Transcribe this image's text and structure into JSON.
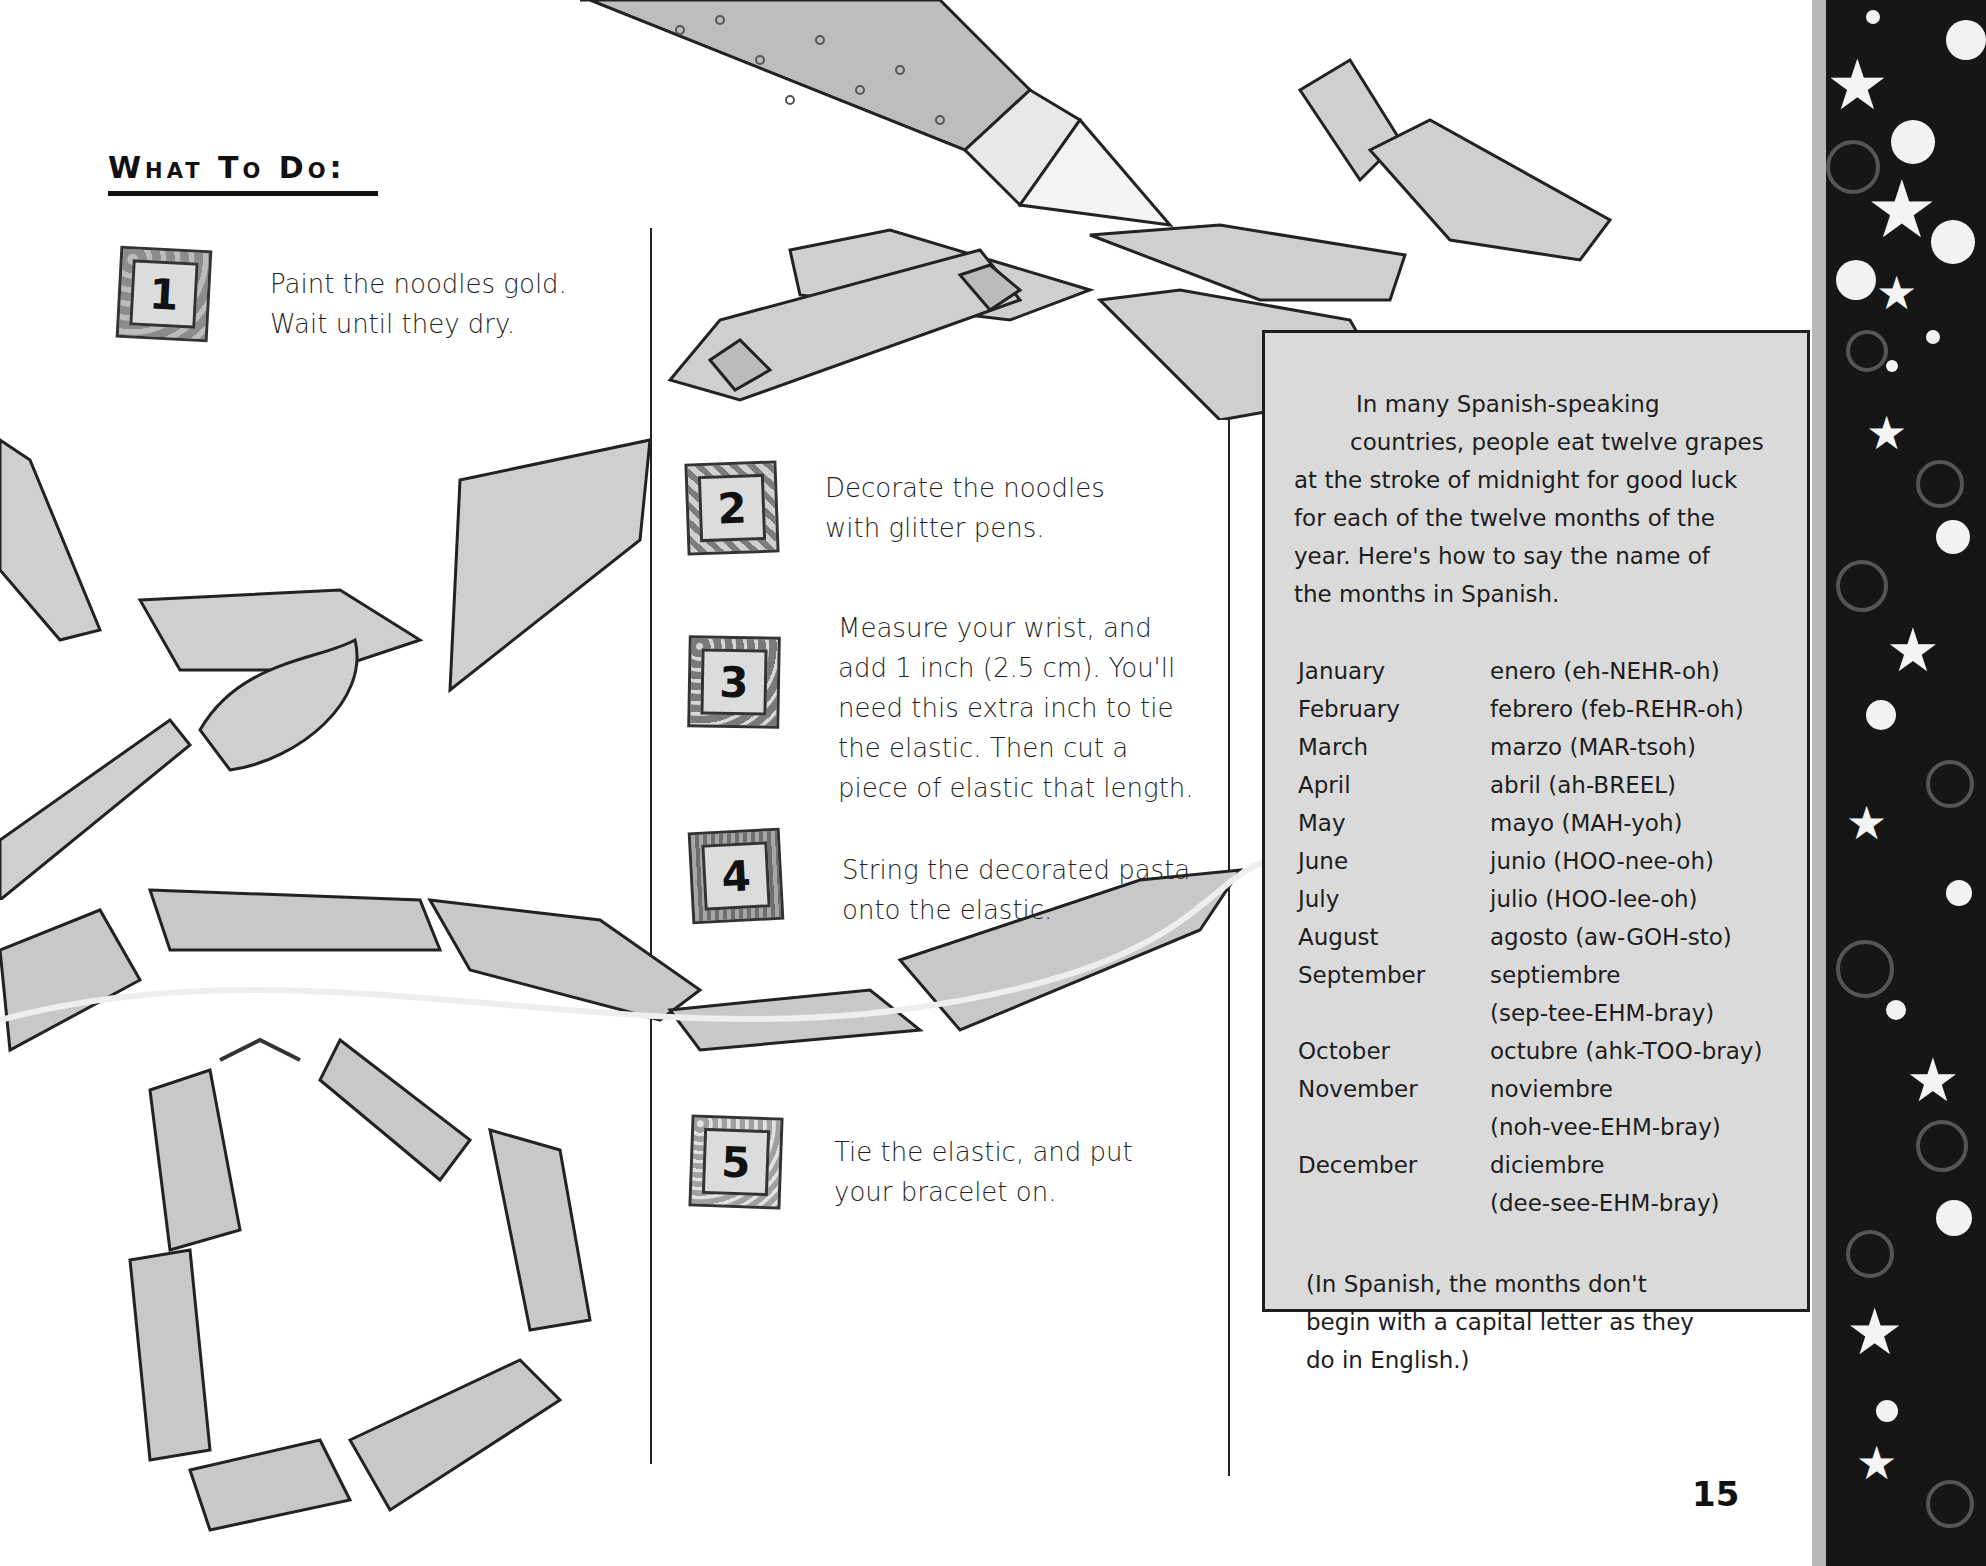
{
  "page": {
    "heading": "What To Do:",
    "page_number": "15"
  },
  "steps": [
    {
      "number": "1",
      "lines": [
        "Paint the noodles gold.",
        "Wait until they dry."
      ]
    },
    {
      "number": "2",
      "lines": [
        "Decorate the noodles",
        "with glitter pens."
      ]
    },
    {
      "number": "3",
      "lines": [
        "Measure your wrist, and",
        "add 1 inch (2.5 cm). You'll",
        "need this extra inch to tie",
        "the elastic. Then cut a",
        "piece of elastic that length."
      ]
    },
    {
      "number": "4",
      "lines": [
        "String the decorated pasta",
        "onto the elastic."
      ]
    },
    {
      "number": "5",
      "lines": [
        "Tie the elastic, and put",
        "your bracelet on."
      ]
    }
  ],
  "sidebar": {
    "intro_lines": [
      "In many Spanish-speaking",
      "countries, people eat twelve grapes",
      "at the stroke of midnight for good luck",
      "for each of the twelve months of the",
      "year. Here's how to say the name of",
      "the months in Spanish."
    ],
    "months": [
      {
        "english": "January",
        "spanish": "enero (eh-NEHR-oh)"
      },
      {
        "english": "February",
        "spanish": "febrero (feb-REHR-oh)"
      },
      {
        "english": "March",
        "spanish": "marzo (MAR-tsoh)"
      },
      {
        "english": "April",
        "spanish": "abril (ah-BREEL)"
      },
      {
        "english": "May",
        "spanish": "mayo (MAH-yoh)"
      },
      {
        "english": "June",
        "spanish": "junio (HOO-nee-oh)"
      },
      {
        "english": "July",
        "spanish": "julio (HOO-lee-oh)"
      },
      {
        "english": "August",
        "spanish": "agosto (aw-GOH-sto)"
      },
      {
        "english": "September",
        "spanish": "septiembre"
      },
      {
        "english": "",
        "spanish": "(sep-tee-EHM-bray)"
      },
      {
        "english": "October",
        "spanish": "octubre (ahk-TOO-bray)"
      },
      {
        "english": "November",
        "spanish": "noviembre"
      },
      {
        "english": "",
        "spanish": "(noh-vee-EHM-bray)"
      },
      {
        "english": "December",
        "spanish": "diciembre"
      },
      {
        "english": "",
        "spanish": "(dee-see-EHM-bray)"
      }
    ],
    "note_lines": [
      "(In Spanish, the months don't",
      "begin with a capital letter as they",
      "do in English.)"
    ]
  },
  "illustrations": {
    "glitter_pen": "glitter-pen-illustration",
    "paintbrush": "paintbrush-illustration",
    "pasta_chain": "pasta-chain-illustration",
    "bracelet": "pasta-bracelet-illustration",
    "border": "starry-border-decoration"
  },
  "colors": {
    "sidebar_bg": "#dadada",
    "border_bg": "#161616",
    "ink": "#1e1e1e"
  }
}
